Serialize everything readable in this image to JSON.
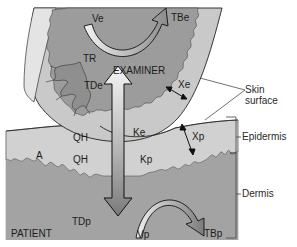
{
  "diagram": {
    "type": "anatomical heat-transfer diagram: examiner fingertip touching patient skin",
    "regions": {
      "examiner": "EXAMINER",
      "patient": "PATIENT"
    },
    "labels": {
      "ve": "Ve",
      "tbe": "TBe",
      "tr": "TR",
      "tde": "TDe",
      "xe": "Xe",
      "ke": "Ke",
      "qh_top": "QH",
      "qh_bottom": "QH",
      "a": "A",
      "kp": "Kp",
      "xp": "Xp",
      "tdp": "TDp",
      "vp": "Vp",
      "tbp": "TBp"
    },
    "right_labels": {
      "skin_surface_line1": "Skin",
      "skin_surface_line2": "surface",
      "epidermis": "Epidermis",
      "dermis": "Dermis"
    },
    "colors": {
      "background": "#ffffff",
      "outer_skin": "#c9c9c9",
      "nail": "#e2e2e2",
      "examiner_core": "#9c9c9c",
      "patient_epidermis": "#cfcfcf",
      "patient_dermis": "#a3a3a3",
      "outline": "#222222"
    }
  }
}
